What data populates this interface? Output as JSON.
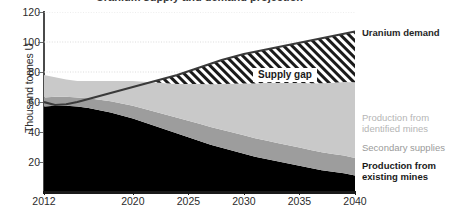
{
  "chart_data": {
    "type": "area",
    "title": "Uranium supply and demand projection",
    "xlabel": "",
    "ylabel": "Thousand tonnes U",
    "xlim": [
      2012,
      2040
    ],
    "ylim": [
      0,
      120
    ],
    "ytick_labels": [
      "20",
      "40",
      "60",
      "80",
      "100",
      "120"
    ],
    "ytick_values": [
      20,
      40,
      60,
      80,
      100,
      120
    ],
    "xtick_labels": [
      "2012",
      "2020",
      "2025",
      "2030",
      "2035",
      "2040"
    ],
    "xtick_values": [
      2012,
      2020,
      2025,
      2030,
      2035,
      2040
    ],
    "grid": "horizontal dotted",
    "legend_position": "right",
    "stacked": true,
    "x": [
      2012,
      2013,
      2014,
      2015,
      2016,
      2017,
      2018,
      2019,
      2020,
      2021,
      2022,
      2023,
      2024,
      2025,
      2026,
      2027,
      2028,
      2029,
      2030,
      2031,
      2032,
      2033,
      2034,
      2035,
      2036,
      2037,
      2038,
      2039,
      2040
    ],
    "series": [
      {
        "name": "Production from existing mines",
        "color": "#000000",
        "values": [
          57,
          57.5,
          57.5,
          57,
          56,
          54.5,
          53,
          51,
          49,
          46.5,
          44,
          41.5,
          39,
          36.5,
          34,
          31.5,
          29.5,
          27.5,
          25.5,
          23.5,
          22,
          20.5,
          19,
          17.5,
          16,
          14.5,
          13.5,
          12.5,
          11
        ]
      },
      {
        "name": "Secondary supplies",
        "color": "#9d9d9d",
        "values": [
          6,
          6,
          6,
          6,
          6.5,
          7,
          7.5,
          8,
          8.5,
          9,
          9.5,
          10,
          10.5,
          11,
          11.5,
          11.8,
          12,
          12.2,
          12.3,
          12.3,
          12.3,
          12.2,
          12.2,
          12.1,
          12,
          12,
          11.9,
          11.8,
          11.7
        ]
      },
      {
        "name": "Production from identified mines",
        "color": "#c9c9c9",
        "values": [
          15,
          13,
          11.5,
          11,
          11.5,
          12.5,
          13.5,
          15,
          16.5,
          18,
          19.5,
          21,
          22.5,
          24.5,
          26.5,
          28.5,
          30.5,
          32.5,
          34.5,
          36.5,
          38.5,
          40,
          41.5,
          43,
          44.5,
          46,
          47.5,
          49,
          50.5
        ]
      }
    ],
    "total_supply": [
      78,
      76.5,
      75,
      74,
      74,
      74,
      74,
      74,
      74,
      73.5,
      73,
      72.5,
      72,
      72,
      72,
      71.8,
      72,
      72.2,
      72.3,
      72.3,
      72.8,
      72.7,
      72.7,
      72.6,
      72.5,
      72.5,
      72.9,
      73.3,
      73.2
    ],
    "line_series": {
      "name": "Uranium demand",
      "color": "#3a3a3a",
      "values": [
        60,
        58,
        58.5,
        60,
        62,
        64,
        66,
        68,
        70,
        72,
        74,
        76,
        78,
        80.5,
        83,
        85.5,
        88,
        90,
        92,
        93.5,
        95,
        96.5,
        98,
        99.5,
        101,
        102.5,
        104,
        105.5,
        107
      ]
    },
    "annotations": [
      {
        "text": "Supply gap",
        "x": 2032,
        "y": 88,
        "description": "Hatched region between total supply and uranium demand"
      }
    ]
  },
  "axis": {
    "ylabel": "Thousand tonnes U"
  },
  "legend": {
    "demand": "Uranium demand",
    "identified": "Production from\nidentified mines",
    "secondary": "Secondary supplies",
    "existing": "Production from\nexisting mines"
  },
  "annotation": {
    "supply_gap": "Supply gap"
  },
  "colors": {
    "existing_mines": "#000000",
    "secondary_supplies": "#9d9d9d",
    "identified_mines": "#c9c9c9",
    "demand_line": "#3a3a3a",
    "gridline": "#d8d8d8",
    "axis": "#1a1a1a",
    "legend_muted": "#b5b5b5"
  }
}
